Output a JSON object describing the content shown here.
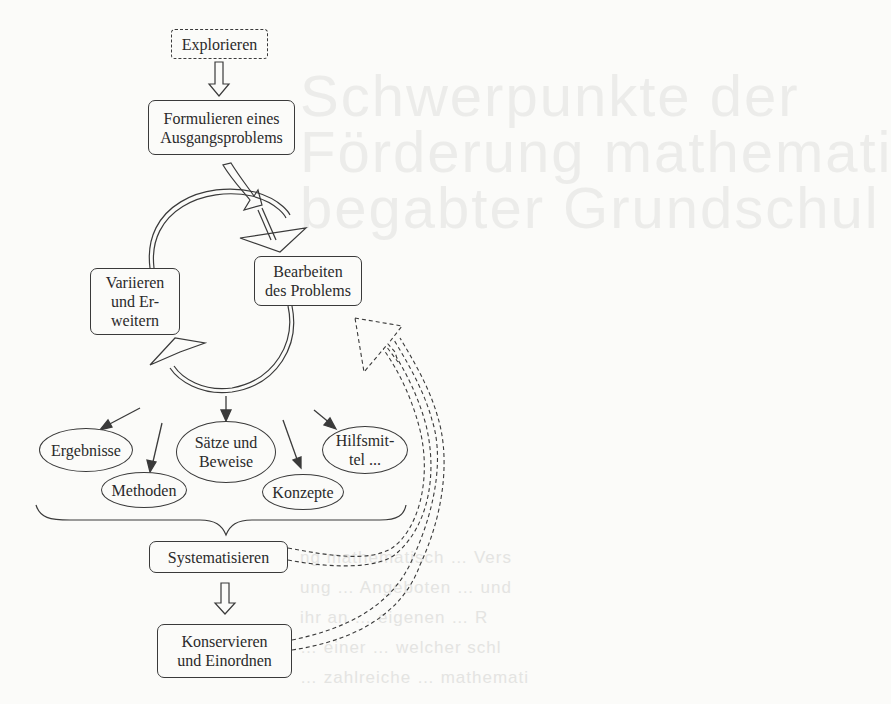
{
  "diagram": {
    "nodes": {
      "explore": {
        "label": "Explorieren",
        "style": "dashed"
      },
      "formulate": {
        "label": "Formulieren eines\nAusgangsproblems"
      },
      "work": {
        "label": "Bearbeiten\ndes Problems"
      },
      "vary": {
        "label": "Variieren\nund Er-\nweitern"
      },
      "systematize": {
        "label": "Systematisieren"
      },
      "conserve": {
        "label": "Konservieren\nund Einordnen"
      }
    },
    "outcomes": [
      {
        "label": "Ergebnisse"
      },
      {
        "label": "Methoden"
      },
      {
        "label": "Sätze und\nBeweise"
      },
      {
        "label": "Konzepte"
      },
      {
        "label": "Hilfsmit-\ntel ..."
      }
    ],
    "edges": [
      {
        "from": "Explorieren",
        "to": "Formulieren eines Ausgangsproblems",
        "type": "hollow-arrow"
      },
      {
        "from": "Formulieren eines Ausgangsproblems",
        "to": "Bearbeiten des Problems",
        "type": "curved-hollow-arrow"
      },
      {
        "from": "Bearbeiten des Problems",
        "to": "Variieren und Erweitern",
        "type": "cycle-arrow"
      },
      {
        "from": "Variieren und Erweitern",
        "to": "Bearbeiten des Problems",
        "type": "cycle-arrow"
      },
      {
        "from": "cycle",
        "to": "outcomes",
        "type": "thin-arrows"
      },
      {
        "from": "outcomes",
        "to": "Systematisieren",
        "type": "brace"
      },
      {
        "from": "Systematisieren",
        "to": "Konservieren und Einordnen",
        "type": "hollow-arrow"
      },
      {
        "from": "Systematisieren",
        "to": "Bearbeiten des Problems",
        "type": "dashed-feedback-arrow"
      },
      {
        "from": "Konservieren und Einordnen",
        "to": "Bearbeiten des Problems",
        "type": "dashed-feedback-arrow"
      }
    ]
  },
  "colors": {
    "background": "#fbfbf9",
    "stroke": "#3a3a3a",
    "text": "#2a2a2a"
  }
}
